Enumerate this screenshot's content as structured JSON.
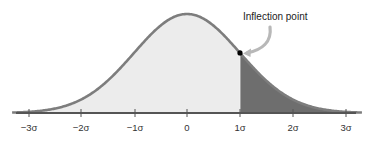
{
  "chart_data": {
    "type": "area",
    "title": "",
    "xlabel": "",
    "ylabel": "",
    "x_ticks": [
      "−3σ",
      "−2σ",
      "−1σ",
      "0",
      "1σ",
      "2σ",
      "3σ"
    ],
    "x_values": [
      -3,
      -2,
      -1,
      0,
      1,
      2,
      3
    ],
    "xlim": [
      -3.3,
      3.3
    ],
    "mean": 0,
    "sd": 1,
    "shaded_region": {
      "from": 1,
      "to": 3.3,
      "label": "tail beyond 1σ"
    },
    "unshaded_region": {
      "from": -3.3,
      "to": 1
    },
    "annotations": [
      {
        "text": "Inflection point",
        "x": 1,
        "marker": "dot",
        "arrow": true
      }
    ],
    "grid": false,
    "legend": "none"
  },
  "axis": {
    "ticks": [
      {
        "label": "−3σ",
        "px": 29
      },
      {
        "label": "−2σ",
        "px": 81
      },
      {
        "label": "−1σ",
        "px": 135
      },
      {
        "label": "0",
        "px": 187
      },
      {
        "label": "1σ",
        "px": 240
      },
      {
        "label": "2σ",
        "px": 293
      },
      {
        "label": "3σ",
        "px": 346
      }
    ]
  },
  "callout": {
    "label": "Inflection point"
  },
  "colors": {
    "light_fill": "#ececec",
    "dark_fill": "#6e6e6e",
    "curve_stroke": "#7d7d7d",
    "axis": "#555555",
    "dot": "#000000",
    "arrow": "#b8b8b8"
  }
}
